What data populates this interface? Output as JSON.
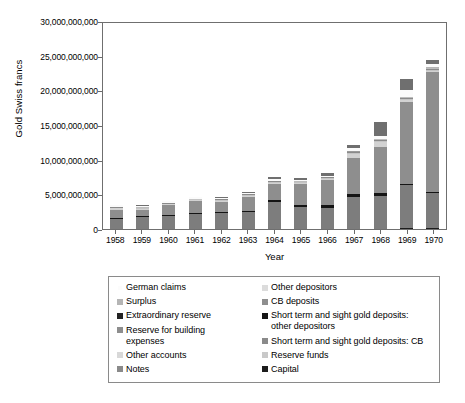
{
  "chart_data": {
    "type": "bar",
    "subtype": "stacked-bar",
    "title": "",
    "xlabel": "Year",
    "ylabel": "Gold Swiss francs",
    "ylim": [
      0,
      30000000000
    ],
    "ytick_values": [
      0,
      5000000000,
      10000000000,
      15000000000,
      20000000000,
      25000000000,
      30000000000
    ],
    "ytick_labels": [
      "0",
      "5,000,000,000",
      "10,000,000,000",
      "15,000,000,000",
      "20,000,000,000",
      "25,000,000,000",
      "30,000,000,000"
    ],
    "grid": false,
    "legend_position": "below-plot",
    "categories": [
      "1958",
      "1959",
      "1960",
      "1961",
      "1962",
      "1963",
      "1964",
      "1965",
      "1966",
      "1967",
      "1968",
      "1969",
      "1970"
    ],
    "series": [
      {
        "name": "Capital",
        "color": "#1c1c1c",
        "values": [
          0,
          0,
          0,
          0,
          0,
          0,
          0,
          0,
          0,
          0,
          0,
          100000000,
          120000000
        ]
      },
      {
        "name": "Notes",
        "color": "#7d7d7d",
        "values": [
          1450000000,
          1700000000,
          1900000000,
          2100000000,
          2280000000,
          2450000000,
          3850000000,
          3150000000,
          3100000000,
          4600000000,
          4800000000,
          6200000000,
          5100000000
        ]
      },
      {
        "name": "Short term and sight gold deposits: other depositors",
        "color": "#141414",
        "values": [
          150000000,
          160000000,
          160000000,
          170000000,
          180000000,
          190000000,
          280000000,
          320000000,
          300000000,
          400000000,
          400000000,
          230000000,
          160000000
        ]
      },
      {
        "name": "CB deposits",
        "color": "#8e8e8e",
        "values": [
          1200000000,
          950000000,
          1350000000,
          1750000000,
          1500000000,
          2000000000,
          2400000000,
          3000000000,
          3700000000,
          5200000000,
          6700000000,
          11800000000,
          17200000000
        ]
      },
      {
        "name": "Other depositors",
        "color": "#d2d2d2",
        "values": [
          180000000,
          130000000,
          130000000,
          130000000,
          140000000,
          160000000,
          170000000,
          160000000,
          160000000,
          600000000,
          650000000,
          250000000,
          180000000
        ]
      },
      {
        "name": "Other accounts",
        "color": "#c4c4c4",
        "values": [
          120000000,
          110000000,
          110000000,
          120000000,
          110000000,
          130000000,
          140000000,
          140000000,
          150000000,
          190000000,
          200000000,
          220000000,
          240000000
        ]
      },
      {
        "name": "Short term and sight gold deposits: CB",
        "color": "#8a8a8a",
        "values": [
          60000000,
          60000000,
          60000000,
          60000000,
          60000000,
          70000000,
          80000000,
          80000000,
          80000000,
          90000000,
          100000000,
          100000000,
          110000000
        ]
      },
      {
        "name": "Reserve funds",
        "color": "#bdbdbd",
        "values": [
          60000000,
          60000000,
          60000000,
          60000000,
          60000000,
          70000000,
          70000000,
          70000000,
          70000000,
          80000000,
          80000000,
          90000000,
          90000000
        ]
      },
      {
        "name": "Reserve for building expenses",
        "color": "#9a9a9a",
        "values": [
          40000000,
          40000000,
          40000000,
          40000000,
          40000000,
          50000000,
          50000000,
          50000000,
          50000000,
          60000000,
          60000000,
          60000000,
          60000000
        ]
      },
      {
        "name": "Extraordinary reserve",
        "color": "#2a2a2a",
        "values": [
          30000000,
          30000000,
          30000000,
          30000000,
          30000000,
          30000000,
          40000000,
          40000000,
          40000000,
          40000000,
          50000000,
          50000000,
          50000000
        ]
      },
      {
        "name": "Surplus",
        "color": "#b5b5b5",
        "values": [
          40000000,
          40000000,
          40000000,
          40000000,
          40000000,
          50000000,
          50000000,
          50000000,
          50000000,
          60000000,
          60000000,
          70000000,
          70000000
        ]
      },
      {
        "name": "German claims",
        "color": "#fbfbfb",
        "values": [
          230000000,
          220000000,
          210000000,
          200000000,
          190000000,
          180000000,
          170000000,
          160000000,
          150000000,
          420000000,
          430000000,
          920000000,
          480000000
        ]
      },
      {
        "name": "Top cap",
        "color": "#6f6f6f",
        "values": [
          90000000,
          90000000,
          100000000,
          110000000,
          110000000,
          120000000,
          330000000,
          330000000,
          350000000,
          480000000,
          1900000000,
          1550000000,
          610000000
        ]
      }
    ],
    "totals": [
      3650000000,
      3550000000,
      4190000000,
      4810000000,
      4740000000,
      5500000000,
      7630000000,
      7550000000,
      8200000000,
      12220000000,
      15430000000,
      21640000000,
      24470000000
    ]
  },
  "axes": {
    "ylabel": "Gold Swiss francs",
    "xlabel": "Year"
  },
  "legend": {
    "columns": [
      {
        "items": [
          {
            "label": "German claims",
            "color": "#fcfcfc"
          },
          {
            "label": "Surplus",
            "color": "#b5b5b5"
          },
          {
            "label": "Extraordinary reserve",
            "color": "#232323"
          },
          {
            "label": "Reserve for building\nexpenses",
            "color": "#8e8e8e"
          },
          {
            "label": "Other accounts",
            "color": "#d8d8d8"
          },
          {
            "label": "Notes",
            "color": "#8a8a8a"
          }
        ]
      },
      {
        "items": [
          {
            "label": "Other depositors",
            "color": "#dcdcdc"
          },
          {
            "label": "CB deposits",
            "color": "#8e8e8e"
          },
          {
            "label": "Short term and sight gold deposits:\nother depositors",
            "color": "#151515"
          },
          {
            "label": "Short term and sight gold deposits: CB",
            "color": "#8a8a8a"
          },
          {
            "label": "Reserve funds",
            "color": "#c9c9c9"
          },
          {
            "label": "Capital",
            "color": "#1c1c1c"
          }
        ]
      }
    ]
  }
}
